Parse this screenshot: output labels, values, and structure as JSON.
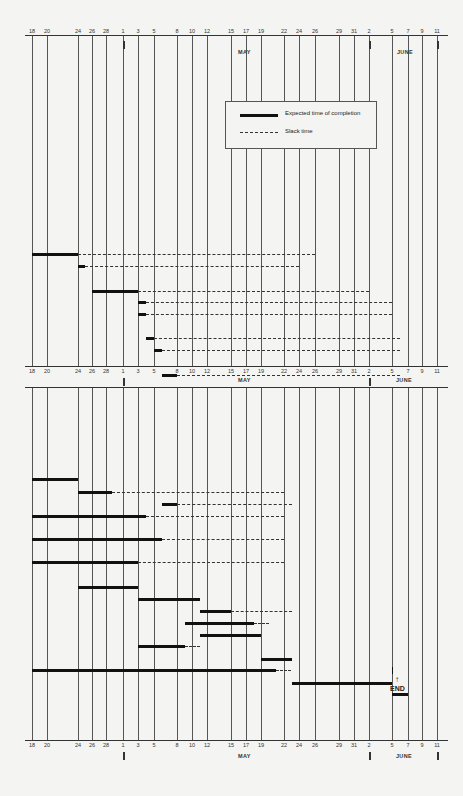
{
  "chart_data": {
    "type": "gantt",
    "title": "",
    "months": [
      {
        "label": "MAY",
        "start_tick": "1"
      },
      {
        "label": "JUNE",
        "start_tick": "2"
      }
    ],
    "tick_labels": [
      "18",
      "20",
      "24",
      "26",
      "28",
      "1",
      "3",
      "5",
      "8",
      "10",
      "12",
      "15",
      "17",
      "19",
      "22",
      "24",
      "26",
      "29",
      "31",
      "2",
      "5",
      "7",
      "9",
      "11"
    ],
    "legend": [
      {
        "style": "solid-thick",
        "label": "Expected time of completion"
      },
      {
        "style": "dashed",
        "label": "Slack time"
      }
    ],
    "panels": [
      {
        "name": "upper",
        "tasks": [
          {
            "start": "Apr 18",
            "end": "Apr 24",
            "slack_end": "May 26"
          },
          {
            "start": "Apr 24",
            "end": "Apr 25",
            "slack_end": "May 24"
          },
          {
            "start": "Apr 26",
            "end": "May 3",
            "slack_end": "Jun 2"
          },
          {
            "start": "May 3",
            "end": "May 4",
            "slack_end": "Jun 5"
          },
          {
            "start": "May 3",
            "end": "May 4",
            "slack_end": "Jun 5"
          },
          {
            "start": "May 4",
            "end": "May 5",
            "slack_end": "Jun 6"
          },
          {
            "start": "May 5",
            "end": "May 6",
            "slack_end": "Jun 6"
          },
          {
            "start": "May 6",
            "end": "May 8",
            "slack_end": "Jun 6"
          }
        ]
      },
      {
        "name": "lower",
        "tasks": [
          {
            "start": "Apr 18",
            "end": "Apr 24",
            "slack_end": null
          },
          {
            "start": "Apr 24",
            "end": "Apr 29",
            "slack_end": "May 22"
          },
          {
            "start": "May 6",
            "end": "May 8",
            "slack_end": "May 23"
          },
          {
            "start": "Apr 18",
            "end": "May 4",
            "slack_end": "May 22"
          },
          {
            "start": "Apr 18",
            "end": "May 6",
            "slack_end": "May 22"
          },
          {
            "start": "Apr 18",
            "end": "May 3",
            "slack_end": "May 22"
          },
          {
            "start": "Apr 24",
            "end": "May 3",
            "slack_end": null
          },
          {
            "start": "May 3",
            "end": "May 11",
            "slack_end": null
          },
          {
            "start": "May 11",
            "end": "May 15",
            "slack_end": "May 23"
          },
          {
            "start": "May 9",
            "end": "May 18",
            "slack_end": "May 20"
          },
          {
            "start": "May 11",
            "end": "May 19",
            "slack_end": null
          },
          {
            "start": "May 3",
            "end": "May 9",
            "slack_end": "May 11"
          },
          {
            "start": "May 19",
            "end": "May 23",
            "slack_end": null
          },
          {
            "start": "Apr 18",
            "end": "May 21",
            "slack_end": "May 23"
          },
          {
            "start": "May 23",
            "end": "Jun 5",
            "slack_end": null
          },
          {
            "start": "Jun 5",
            "end": "Jun 7",
            "slack_end": null
          }
        ]
      }
    ],
    "annotations": [
      "END"
    ]
  },
  "legend": {
    "expected": "Expected time of completion",
    "slack": "Slack time"
  },
  "months": {
    "may": "MAY",
    "june": "JUNE"
  },
  "end_label": "END",
  "arrow": "↑"
}
